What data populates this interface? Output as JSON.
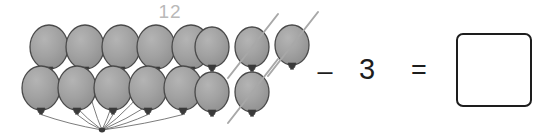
{
  "worksheet": {
    "type": "subtraction-with-pictures",
    "group_count_label": "12",
    "operator": "–",
    "subtrahend": "3",
    "equals": "=",
    "answer_value": "",
    "answer_placeholder": ""
  },
  "colors": {
    "balloon_fill": "#9e9e9e",
    "balloon_stroke": "#4a4a4a",
    "balloon_highlight": "#b5b5b5",
    "knot_fill": "#3a3a3a",
    "string": "#5a5a5a",
    "strike": "#a8a8a8",
    "label_text": "#b9b9b9",
    "math_text": "#1d1d1d",
    "box_border": "#1d1d1d",
    "background": "#ffffff"
  },
  "bunch": {
    "name": "balloon-bunch",
    "total": 10,
    "knot_point": {
      "x": 102,
      "y": 130
    },
    "rows": [
      {
        "row": "top",
        "balloons": [
          {
            "cx": 49,
            "cy": 47,
            "rx": 19,
            "ry": 22,
            "crossed": false
          },
          {
            "cx": 85,
            "cy": 47,
            "rx": 19,
            "ry": 22,
            "crossed": false
          },
          {
            "cx": 121,
            "cy": 47,
            "rx": 19,
            "ry": 22,
            "crossed": false
          },
          {
            "cx": 156,
            "cy": 47,
            "rx": 19,
            "ry": 22,
            "crossed": false
          },
          {
            "cx": 191,
            "cy": 47,
            "rx": 19,
            "ry": 22,
            "crossed": false
          }
        ]
      },
      {
        "row": "bottom",
        "balloons": [
          {
            "cx": 41,
            "cy": 88,
            "rx": 19,
            "ry": 22,
            "crossed": false
          },
          {
            "cx": 77,
            "cy": 88,
            "rx": 19,
            "ry": 22,
            "crossed": false
          },
          {
            "cx": 113,
            "cy": 88,
            "rx": 19,
            "ry": 22,
            "crossed": false
          },
          {
            "cx": 148,
            "cy": 88,
            "rx": 19,
            "ry": 22,
            "crossed": false
          },
          {
            "cx": 183,
            "cy": 88,
            "rx": 19,
            "ry": 22,
            "crossed": false
          }
        ]
      }
    ]
  },
  "loose": {
    "name": "loose-balloons",
    "total": 5,
    "crossed_out_count": 3,
    "rows": [
      {
        "row": "top",
        "balloons": [
          {
            "cx": 212,
            "cy": 47,
            "rx": 17,
            "ry": 20,
            "crossed": false
          },
          {
            "cx": 252,
            "cy": 47,
            "rx": 17,
            "ry": 20,
            "crossed": true
          },
          {
            "cx": 292,
            "cy": 45,
            "rx": 17,
            "ry": 20,
            "crossed": true
          }
        ]
      },
      {
        "row": "bottom",
        "balloons": [
          {
            "cx": 212,
            "cy": 92,
            "rx": 17,
            "ry": 20,
            "crossed": false
          },
          {
            "cx": 252,
            "cy": 92,
            "rx": 17,
            "ry": 20,
            "crossed": true
          }
        ]
      }
    ]
  }
}
